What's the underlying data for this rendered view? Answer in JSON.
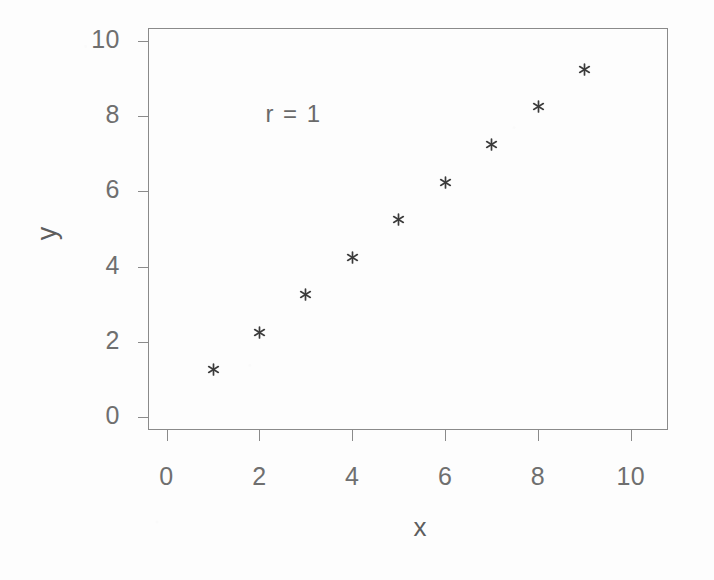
{
  "chart_data": {
    "type": "scatter",
    "title": "",
    "subtitle": "",
    "xlabel": "x",
    "ylabel": "y",
    "xlim": [
      -0.4,
      10.8
    ],
    "ylim": [
      -0.35,
      10.35
    ],
    "xticks": [
      "0",
      "2",
      "4",
      "6",
      "8",
      "10"
    ],
    "xtick_values": [
      0,
      2,
      4,
      6,
      8,
      10
    ],
    "yticks": [
      "0",
      "2",
      "4",
      "6",
      "8",
      "10"
    ],
    "ytick_values": [
      0,
      2,
      4,
      6,
      8,
      10
    ],
    "grid": false,
    "legend": null,
    "legend_position": "none",
    "marker": "asterisk",
    "marker_color": "#3b3b3b",
    "frame_color": "#8a8a8a",
    "text_color": "#6a6a6a",
    "annotations": [
      {
        "text": "r = 1",
        "x": 2.0,
        "y": 8.0
      }
    ],
    "series": [
      {
        "name": "points",
        "x": [
          1,
          2,
          3,
          4,
          5,
          6,
          7,
          8,
          9
        ],
        "y": [
          1.25,
          2.25,
          3.25,
          4.25,
          5.25,
          6.25,
          7.25,
          8.25,
          9.25
        ],
        "points": [
          {
            "x": 1,
            "y": 1.25
          },
          {
            "x": 2,
            "y": 2.25
          },
          {
            "x": 3,
            "y": 3.25
          },
          {
            "x": 4,
            "y": 4.25
          },
          {
            "x": 5,
            "y": 5.25
          },
          {
            "x": 6,
            "y": 6.25
          },
          {
            "x": 7,
            "y": 7.25
          },
          {
            "x": 8,
            "y": 8.25
          },
          {
            "x": 9,
            "y": 9.25
          }
        ]
      }
    ]
  },
  "figure": {
    "annotation_text": "r = 1",
    "x_axis_title": "x",
    "y_axis_title": "y"
  }
}
